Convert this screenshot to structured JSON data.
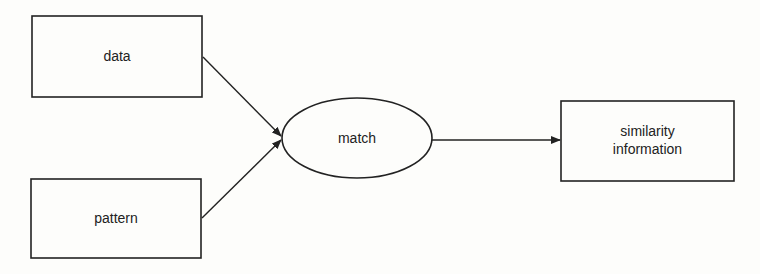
{
  "diagram": {
    "nodes": [
      {
        "id": "data",
        "label": "data",
        "shape": "rectangle"
      },
      {
        "id": "pattern",
        "label": "pattern",
        "shape": "rectangle"
      },
      {
        "id": "match",
        "label": "match",
        "shape": "ellipse"
      },
      {
        "id": "similarity",
        "label_line1": "similarity",
        "label_line2": "information",
        "shape": "rectangle"
      }
    ],
    "edges": [
      {
        "from": "data",
        "to": "match"
      },
      {
        "from": "pattern",
        "to": "match"
      },
      {
        "from": "match",
        "to": "similarity"
      }
    ]
  }
}
